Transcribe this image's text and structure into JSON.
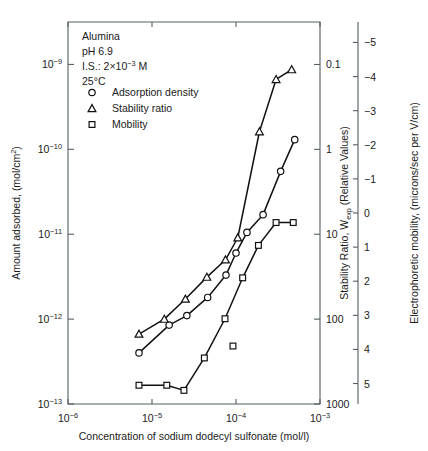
{
  "figure": {
    "background_color": "#ffffff",
    "line_color": "#111111",
    "axis_color": "#555f63",
    "marker_fill": "#ffffff"
  },
  "annotations": {
    "sample": "Alumina",
    "ph": "pH 6.9",
    "ionic_strength_prefix": "I.S.: 2×10",
    "ionic_strength_exponent": "−3",
    "ionic_strength_suffix": " M",
    "temperature": "25°C"
  },
  "legend": {
    "entries": [
      {
        "symbol": "circle",
        "label": "Adsorption density"
      },
      {
        "symbol": "triangle",
        "label": "Stability ratio"
      },
      {
        "symbol": "square",
        "label": "Mobility"
      }
    ]
  },
  "chart_data": {
    "type": "scatter",
    "title": "",
    "xlabel": "Concentration of sodium dodecyl sulfonate (mol/l)",
    "xscale": "log",
    "xlim": [
      1e-06,
      0.001
    ],
    "xticks": [
      1e-06,
      1e-05,
      0.0001,
      0.001
    ],
    "xtick_labels": [
      "10−6",
      "10−5",
      "10−4",
      "10−3"
    ],
    "grid": false,
    "legend_position": "upper-left",
    "axes": [
      {
        "id": "left",
        "label": "Amount adsorbed, (mol/cm²)",
        "scale": "log",
        "lim": [
          1e-13,
          3.16e-09
        ],
        "ticks": [
          1e-09,
          1e-10,
          1e-11,
          1e-12,
          1e-13
        ],
        "tick_labels": [
          "10−9",
          "10−10",
          "10−11",
          "10−12",
          "10−13"
        ],
        "direction": "increasing-up"
      },
      {
        "id": "right-stability",
        "label": "Stability Ratio, W",
        "label_subscript": "exp",
        "label_suffix": " (Relative Values)",
        "scale": "log",
        "lim": [
          1000,
          0.0316
        ],
        "ticks": [
          0.1,
          1,
          10,
          100,
          1000
        ],
        "tick_labels": [
          "0.1",
          "1",
          "10",
          "100",
          "1000"
        ],
        "direction": "decreasing-up"
      },
      {
        "id": "right-mobility",
        "label": "Electrophoretic mobility, (microns/sec per V/cm)",
        "scale": "linear",
        "lim": [
          5.6,
          -5.6
        ],
        "ticks": [
          -5,
          -4,
          -3,
          -2,
          -1,
          0,
          1,
          2,
          3,
          4,
          5
        ],
        "tick_labels": [
          "−5",
          "−4",
          "−3",
          "−2",
          "−1",
          "0",
          "1",
          "2",
          "3",
          "4",
          "5"
        ],
        "direction": "decreasing-up"
      }
    ],
    "series": [
      {
        "name": "Adsorption density",
        "symbol": "circle",
        "axis": "left",
        "units": "mol/cm^2",
        "x": [
          7e-06,
          1.6e-05,
          2.6e-05,
          4.6e-05,
          7.6e-05,
          0.0001,
          0.000135,
          0.00021,
          0.00034,
          0.0005
        ],
        "y": [
          4e-13,
          8.5e-13,
          1.1e-12,
          1.8e-12,
          3.3e-12,
          6e-12,
          1.05e-11,
          1.7e-11,
          5.5e-11,
          1.3e-10
        ],
        "connected": true
      },
      {
        "name": "Stability ratio",
        "symbol": "triangle",
        "axis": "right-stability",
        "units": "relative",
        "x": [
          7e-06,
          1.4e-05,
          2.5e-05,
          4.5e-05,
          7.5e-05,
          0.000105,
          0.00019,
          0.0003,
          0.00046
        ],
        "y": [
          150,
          100,
          58,
          32,
          20,
          11,
          0.62,
          0.15,
          0.115
        ],
        "connected": true
      },
      {
        "name": "Mobility",
        "symbol": "square",
        "axis": "right-mobility",
        "units": "microns/sec per V/cm",
        "x": [
          7e-06,
          1.5e-05,
          2.4e-05,
          4.2e-05,
          7.4e-05,
          0.00012,
          0.000185,
          0.0003,
          0.00048
        ],
        "y": [
          5.05,
          5.05,
          5.2,
          4.25,
          3.1,
          1.9,
          0.95,
          0.28,
          0.28
        ],
        "connected": true
      },
      {
        "name": "Mobility outlier",
        "symbol": "square",
        "axis": "right-mobility",
        "units": "microns/sec per V/cm",
        "x": [
          9.2e-05
        ],
        "y": [
          3.9
        ],
        "connected": false
      }
    ]
  }
}
